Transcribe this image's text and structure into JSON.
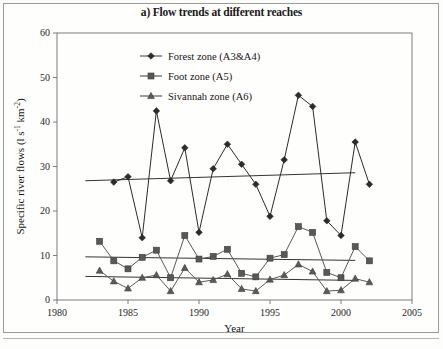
{
  "figure": {
    "title": "a) Flow trends at different reaches",
    "panel_label": "a)"
  },
  "chart_data": {
    "type": "line",
    "title": "a) Flow trends at different reaches",
    "xlabel": "Year",
    "ylabel": "Specific river flows (l s-1 km-2)",
    "ylabel_parts": {
      "prefix": "Specific river flows (l s",
      "sup1": "-1",
      "mid": "km",
      "sup2": "-2",
      "suffix": ")"
    },
    "xlim": [
      1980,
      2005
    ],
    "ylim": [
      0,
      60
    ],
    "xticks": [
      1980,
      1985,
      1990,
      1995,
      2000,
      2005
    ],
    "yticks": [
      0,
      10,
      20,
      30,
      40,
      50,
      60
    ],
    "grid": false,
    "legend_position": "top-center-inside",
    "series": [
      {
        "name": "Forest zone (A3&A4)",
        "marker": "diamond",
        "color": "#2b2b2b",
        "x": [
          1984,
          1985,
          1986,
          1987,
          1988,
          1989,
          1990,
          1991,
          1992,
          1993,
          1994,
          1995,
          1996,
          1997,
          1998,
          1999,
          2000,
          2001,
          2002
        ],
        "values": [
          26.5,
          27.7,
          14.0,
          42.5,
          26.8,
          34.2,
          15.2,
          29.5,
          35.0,
          30.5,
          26.0,
          18.8,
          31.5,
          46.0,
          43.5,
          17.8,
          14.5,
          35.5,
          26.0
        ],
        "trend": {
          "x": [
            1982,
            1903,
            2001,
            2001
          ],
          "y1": 26.8,
          "y2": 28.6,
          "x1": 1982,
          "x2": 2001
        }
      },
      {
        "name": "Foot zone (A5)",
        "marker": "square",
        "color": "#585858",
        "x": [
          1983,
          1984,
          1985,
          1986,
          1987,
          1988,
          1989,
          1990,
          1991,
          1992,
          1993,
          1994,
          1995,
          1996,
          1997,
          1998,
          1999,
          2000,
          2001,
          2002
        ],
        "values": [
          13.2,
          8.8,
          7.0,
          9.6,
          11.2,
          5.0,
          14.5,
          9.2,
          9.8,
          11.4,
          6.0,
          5.2,
          9.4,
          10.2,
          16.5,
          15.2,
          6.2,
          5.0,
          12.0,
          8.8
        ],
        "trend": {
          "y1": 9.7,
          "y2": 8.9,
          "x1": 1982,
          "x2": 2001
        }
      },
      {
        "name": "Sivannah zone (A6)",
        "marker": "triangle",
        "color": "#5a5a5a",
        "x": [
          1983,
          1984,
          1985,
          1986,
          1987,
          1988,
          1989,
          1990,
          1991,
          1992,
          1993,
          1994,
          1995,
          1996,
          1997,
          1998,
          1999,
          2000,
          2001,
          2002
        ],
        "values": [
          6.6,
          4.2,
          2.6,
          5.0,
          5.6,
          2.0,
          7.2,
          4.0,
          4.5,
          5.8,
          2.5,
          2.0,
          4.6,
          5.6,
          8.0,
          6.4,
          2.0,
          2.2,
          4.8,
          4.0
        ],
        "trend": {
          "y1": 5.3,
          "y2": 4.4,
          "x1": 1982,
          "x2": 2001
        }
      }
    ]
  },
  "legend": {
    "items": [
      {
        "label": "Forest zone (A3&A4)",
        "marker": "diamond"
      },
      {
        "label": "Foot zone (A5)",
        "marker": "square"
      },
      {
        "label": "Sivannah zone (A6)",
        "marker": "triangle"
      }
    ]
  }
}
